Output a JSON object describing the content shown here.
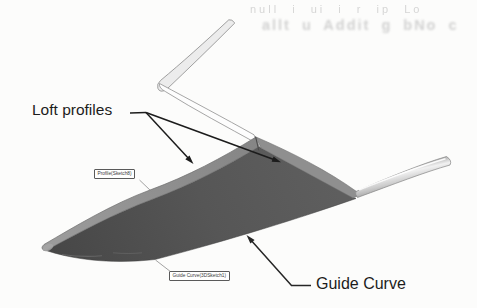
{
  "annotations": {
    "loft_profiles": "Loft profiles",
    "guide_curve": "Guide Curve"
  },
  "callouts": {
    "profile": "Profile(Sketch8)",
    "guide_curve": "Guide Curve(3DSketch1)"
  },
  "bleed_through": {
    "row1": "null i ui i r ip Lo",
    "row2": "allt u  Addit g bNo c"
  },
  "colors": {
    "page_bg": "#fcfcfb",
    "wing_dark": "#525252",
    "edge_band": "#8f8f8f",
    "tube_gray": "#d9d9d9",
    "annotation": "#1c1c1c",
    "callout_border": "#5a5a5a",
    "bleed": "#b0b0b0",
    "outline_gray": "#8a8a8a"
  }
}
